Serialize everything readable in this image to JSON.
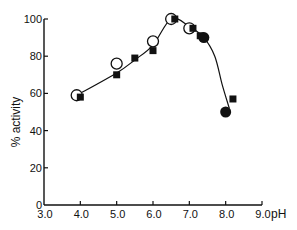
{
  "chart_data": {
    "type": "scatter",
    "title": "",
    "xlabel": "pH",
    "ylabel": "% activity",
    "xlim": [
      3.0,
      9.0
    ],
    "ylim": [
      0,
      100
    ],
    "x_ticks": [
      "3.0",
      "4.0",
      "5.0",
      "6.0",
      "7.0",
      "8.0",
      "9.0"
    ],
    "y_ticks": [
      "0",
      "20",
      "40",
      "60",
      "80",
      "100"
    ],
    "grid": false,
    "legend": null,
    "series": [
      {
        "name": "open circles",
        "marker": "open-circle",
        "points": [
          [
            3.9,
            59
          ],
          [
            5.0,
            76
          ],
          [
            6.0,
            88
          ],
          [
            6.5,
            100
          ],
          [
            7.0,
            95
          ]
        ]
      },
      {
        "name": "filled squares",
        "marker": "filled-square",
        "points": [
          [
            4.0,
            58
          ],
          [
            5.0,
            70
          ],
          [
            5.5,
            79
          ],
          [
            6.0,
            83
          ],
          [
            6.6,
            100
          ],
          [
            7.1,
            95
          ],
          [
            7.3,
            91
          ],
          [
            8.2,
            57
          ]
        ]
      },
      {
        "name": "filled circles",
        "marker": "filled-circle",
        "points": [
          [
            7.4,
            90
          ],
          [
            8.0,
            50
          ]
        ]
      }
    ],
    "fit_curve": [
      [
        3.9,
        59
      ],
      [
        5.0,
        71
      ],
      [
        5.5,
        78
      ],
      [
        6.0,
        86
      ],
      [
        6.5,
        100
      ],
      [
        7.0,
        96
      ],
      [
        7.4,
        90
      ],
      [
        7.7,
        80
      ],
      [
        7.9,
        65
      ],
      [
        8.1,
        52
      ]
    ]
  }
}
